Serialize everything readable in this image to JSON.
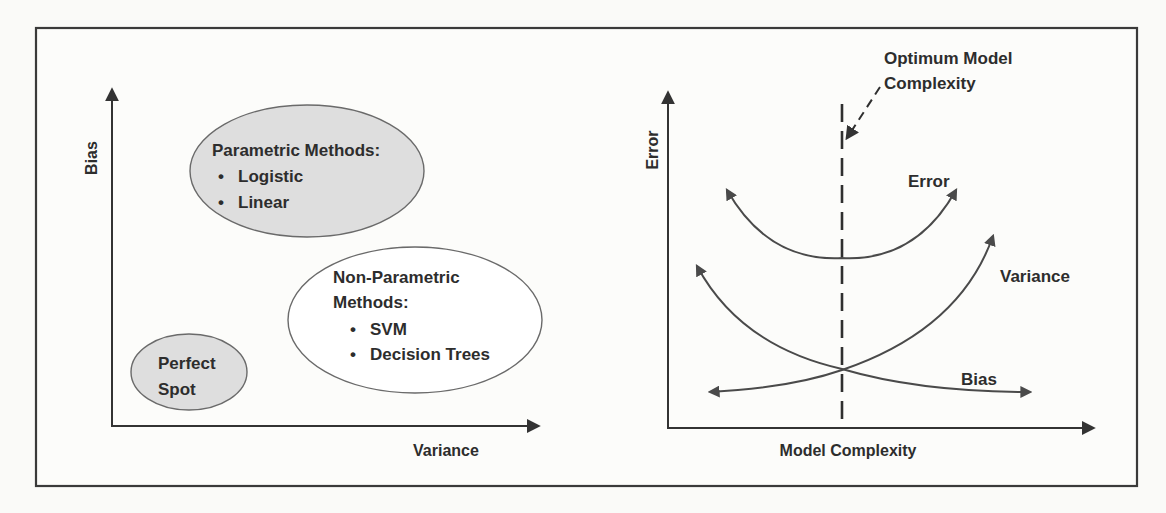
{
  "figure": {
    "colors": {
      "frame": "#3a3a3a",
      "axis": "#333333",
      "text": "#2d2d2d",
      "ellipse_fill_gray": "#dedede",
      "ellipse_fill_white": "#ffffff",
      "ellipse_stroke": "#6a6a6a",
      "curve": "#4a4a4a"
    },
    "left_panel": {
      "y_axis_label": "Bias",
      "x_axis_label": "Variance",
      "regions": [
        {
          "id": "parametric",
          "title": "Parametric Methods:",
          "items": [
            "Logistic",
            "Linear"
          ],
          "filled": true
        },
        {
          "id": "non-parametric",
          "title_line1": "Non-Parametric",
          "title_line2": "Methods:",
          "items": [
            "SVM",
            "Decision Trees"
          ],
          "filled": false
        },
        {
          "id": "perfect-spot",
          "line1": "Perfect",
          "line2": "Spot",
          "filled": true
        }
      ]
    },
    "right_panel": {
      "y_axis_label": "Error",
      "x_axis_label": "Model Complexity",
      "annotation_line1": "Optimum Model",
      "annotation_line2": "Complexity",
      "curves": {
        "error": "Error",
        "variance": "Variance",
        "bias": "Bias"
      }
    },
    "bullet_glyph": "•"
  }
}
